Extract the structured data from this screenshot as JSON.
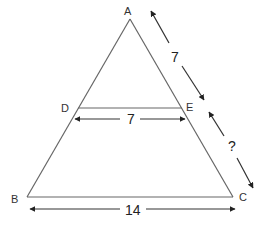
{
  "diagram": {
    "type": "triangle-midsegment",
    "vertices": {
      "A": "A",
      "B": "B",
      "C": "C",
      "D": "D",
      "E": "E"
    },
    "measurements": {
      "AE": "7",
      "EC": "?",
      "DE": "7",
      "BC": "14"
    },
    "colors": {
      "line": "#555555",
      "arrow": "#222222",
      "background": "#ffffff"
    }
  }
}
